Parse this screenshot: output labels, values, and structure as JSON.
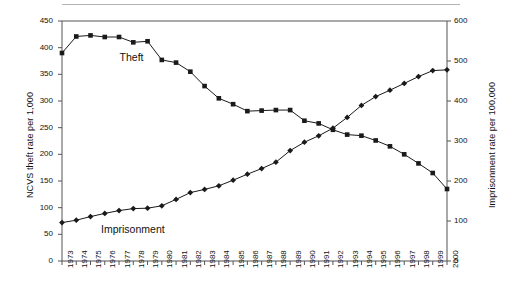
{
  "chart_data": {
    "type": "line",
    "title": "",
    "subtitle": "",
    "xlabel": "",
    "grid": false,
    "legend_position": "inline-annotation",
    "x": [
      1973,
      1974,
      1975,
      1976,
      1977,
      1978,
      1979,
      1980,
      1981,
      1982,
      1983,
      1984,
      1985,
      1986,
      1987,
      1988,
      1989,
      1990,
      1991,
      1992,
      1993,
      1994,
      1995,
      1996,
      1997,
      1998,
      1999,
      2000
    ],
    "categories": [
      "1973",
      "1974",
      "1975",
      "1976",
      "1977",
      "1978",
      "1979",
      "1980",
      "1981",
      "1982",
      "1983",
      "1984",
      "1985",
      "1986",
      "1987",
      "1988",
      "1989",
      "1990",
      "1991",
      "1992",
      "1993",
      "1994",
      "1995",
      "1996",
      "1997",
      "1998",
      "1999",
      "2000"
    ],
    "axes": {
      "left": {
        "label": "NCVS theft rate per 1,000",
        "ticks": [
          0,
          50,
          100,
          150,
          200,
          250,
          300,
          350,
          400,
          450
        ],
        "ylim": [
          0,
          450
        ]
      },
      "right": {
        "label": "Imprisonment rate per 100,000",
        "ticks": [
          0,
          100,
          200,
          300,
          400,
          500,
          600
        ],
        "ylim": [
          0,
          600
        ]
      },
      "bottom": {
        "label": "",
        "ticks": [
          "1973",
          "1974",
          "1975",
          "1976",
          "1977",
          "1978",
          "1979",
          "1980",
          "1981",
          "1982",
          "1983",
          "1984",
          "1985",
          "1986",
          "1987",
          "1988",
          "1989",
          "1990",
          "1991",
          "1992",
          "1993",
          "1994",
          "1995",
          "1996",
          "1997",
          "1998",
          "1999",
          "2000"
        ]
      }
    },
    "series": [
      {
        "name": "Theft",
        "axis": "left",
        "marker": "square",
        "color": "#1a1a1a",
        "values": [
          390,
          421,
          423,
          420,
          420,
          410,
          412,
          377,
          372,
          355,
          328,
          305,
          294,
          281,
          282,
          283,
          283,
          263,
          258,
          246,
          237,
          235,
          226,
          215,
          200,
          183,
          165,
          135
        ]
      },
      {
        "name": "Imprisonment",
        "axis": "right",
        "marker": "diamond",
        "color": "#1a1a1a",
        "values": [
          96,
          102,
          111,
          119,
          126,
          131,
          132,
          138,
          154,
          171,
          179,
          188,
          202,
          217,
          231,
          247,
          276,
          297,
          313,
          332,
          359,
          389,
          411,
          427,
          444,
          461,
          476,
          478
        ]
      }
    ],
    "annotations": [
      {
        "text": "Theft",
        "near_x": 1979,
        "note": "label for upper-left series"
      },
      {
        "text": "Imprisonment",
        "near_x": 1977,
        "note": "label for lower-left series"
      }
    ]
  },
  "labels": {
    "theft": "Theft",
    "imprisonment": "Imprisonment",
    "y_left_title": "NCVS theft rate per 1,000",
    "y_right_title": "Imprisonment rate per 100,000"
  }
}
